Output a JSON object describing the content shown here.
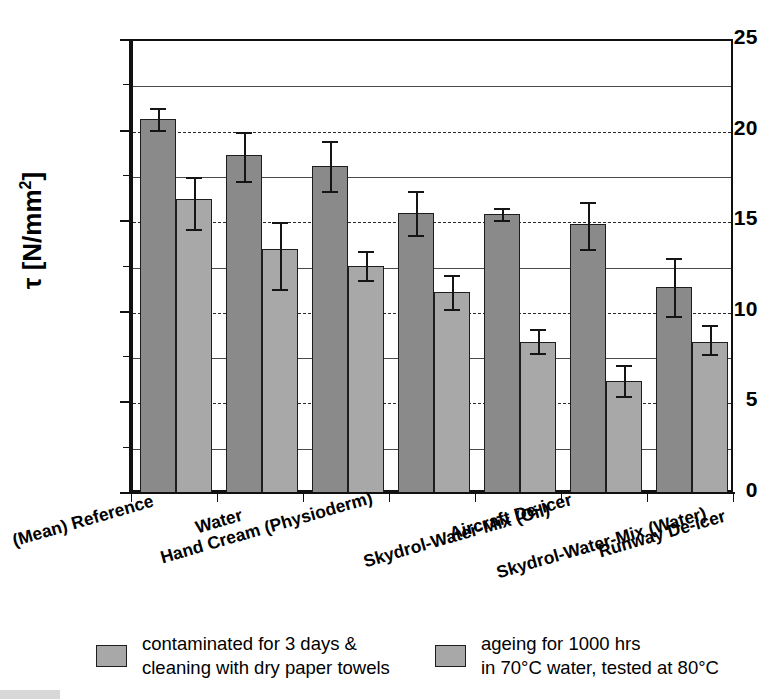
{
  "chart_data": {
    "type": "bar",
    "title": "",
    "xlabel": "",
    "ylabel": "τ [N/mm²]",
    "ylim": [
      0,
      25
    ],
    "yticks": [
      0,
      5,
      10,
      15,
      20,
      25
    ],
    "ytick_labels": [
      "0",
      "5",
      "10",
      "15",
      "20",
      "25"
    ],
    "yminor_ticks": [
      2.5,
      7.5,
      12.5,
      17.5,
      22.5
    ],
    "grid": {
      "solid_at": [
        2.5,
        7.5,
        12.5,
        17.5,
        22.5
      ],
      "dashed_at": [
        5,
        10,
        15,
        20
      ],
      "position": "horizontal"
    },
    "categories": [
      "(Mean) Reference",
      "Water",
      "Hand Cream (Physioderm)",
      "Aircraft De-icer",
      "Skydrol-Water-Mix (Oil)",
      "Skydrol-Water-Mix (Water)",
      "Runway De-icer"
    ],
    "series": [
      {
        "name": "contaminated for 3 days & cleaning with dry paper towels",
        "color": "#8a8a8a",
        "values": [
          20.7,
          18.7,
          18.1,
          15.5,
          15.45,
          14.9,
          11.4
        ],
        "errors_low": [
          20.1,
          17.3,
          16.7,
          14.3,
          15.1,
          13.5,
          9.8
        ],
        "errors_high": [
          21.3,
          20.0,
          19.5,
          16.7,
          15.8,
          16.1,
          13.0
        ]
      },
      {
        "name": "ageing for 1000 hrs in 70°C water, tested at 80°C",
        "color": "#a8a8a8",
        "values": [
          16.3,
          13.5,
          12.6,
          11.15,
          8.4,
          6.25,
          8.4
        ],
        "errors_low": [
          14.6,
          11.3,
          11.8,
          10.2,
          7.8,
          5.4,
          7.7
        ],
        "errors_high": [
          17.5,
          15.0,
          13.4,
          12.1,
          9.1,
          7.1,
          9.3
        ]
      }
    ],
    "legend": {
      "position": "bottom",
      "entries": [
        {
          "line1": "contaminated for 3 days &",
          "line2": "cleaning with dry paper towels"
        },
        {
          "line1": "ageing for 1000 hrs",
          "line2": "in 70°C water, tested at 80°C"
        }
      ]
    }
  }
}
